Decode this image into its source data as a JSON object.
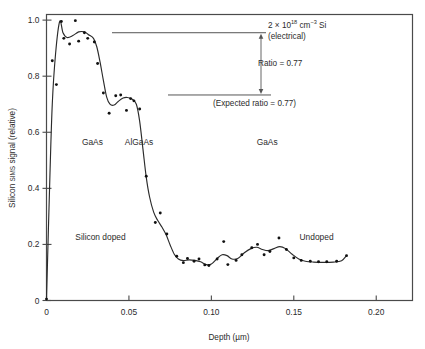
{
  "chart_data": {
    "type": "scatter",
    "title": "",
    "xlabel": "Depth  (µm)",
    "ylabel": "Silicon SIMS signal  (relative)",
    "ylabel_parts": {
      "pre": "Silicon ",
      "smallcaps": "SIMS",
      "post": " signal  (relative)"
    },
    "xlim": [
      0,
      0.222
    ],
    "ylim": [
      0,
      1.02
    ],
    "xticks": [
      0,
      0.05,
      0.1,
      0.15,
      0.2
    ],
    "xticklabels": [
      "0",
      "0.05",
      "0.10",
      "0.15",
      "0.20"
    ],
    "yticks": [
      0,
      0.2,
      0.4,
      0.6,
      0.8,
      1.0
    ],
    "yticklabels": [
      "0",
      "0.2",
      "0.4",
      "0.6",
      "0.8",
      "1.0"
    ],
    "grid": false,
    "legend": "none",
    "series": [
      {
        "name": "Silicon SIMS signal (data points)",
        "marker": "dot",
        "points": [
          [
            0.0,
            0.005
          ],
          [
            0.0035,
            0.855
          ],
          [
            0.006,
            0.77
          ],
          [
            0.009,
            0.995
          ],
          [
            0.0105,
            0.935
          ],
          [
            0.014,
            0.915
          ],
          [
            0.0175,
            0.998
          ],
          [
            0.0195,
            0.925
          ],
          [
            0.023,
            0.955
          ],
          [
            0.025,
            0.935
          ],
          [
            0.029,
            0.922
          ],
          [
            0.031,
            0.845
          ],
          [
            0.0345,
            0.74
          ],
          [
            0.038,
            0.668
          ],
          [
            0.042,
            0.73
          ],
          [
            0.045,
            0.733
          ],
          [
            0.0485,
            0.678
          ],
          [
            0.051,
            0.72
          ],
          [
            0.053,
            0.712
          ],
          [
            0.0565,
            0.683
          ],
          [
            0.0605,
            0.443
          ],
          [
            0.066,
            0.278
          ],
          [
            0.069,
            0.312
          ],
          [
            0.073,
            0.237
          ],
          [
            0.079,
            0.158
          ],
          [
            0.083,
            0.135
          ],
          [
            0.0855,
            0.15
          ],
          [
            0.0895,
            0.14
          ],
          [
            0.0925,
            0.148
          ],
          [
            0.096,
            0.127
          ],
          [
            0.0985,
            0.125
          ],
          [
            0.1035,
            0.148
          ],
          [
            0.1075,
            0.21
          ],
          [
            0.11,
            0.128
          ],
          [
            0.115,
            0.143
          ],
          [
            0.1185,
            0.163
          ],
          [
            0.1245,
            0.188
          ],
          [
            0.128,
            0.2
          ],
          [
            0.132,
            0.163
          ],
          [
            0.1355,
            0.175
          ],
          [
            0.141,
            0.223
          ],
          [
            0.1455,
            0.182
          ],
          [
            0.15,
            0.152
          ],
          [
            0.1545,
            0.143
          ],
          [
            0.16,
            0.14
          ],
          [
            0.165,
            0.138
          ],
          [
            0.17,
            0.138
          ],
          [
            0.176,
            0.14
          ],
          [
            0.182,
            0.16
          ]
        ]
      },
      {
        "name": "Smoothed profile (fitted curve)",
        "marker": "line",
        "points": [
          [
            0.0,
            0.005
          ],
          [
            0.002,
            0.43
          ],
          [
            0.0035,
            0.7
          ],
          [
            0.0055,
            0.88
          ],
          [
            0.008,
            0.995
          ],
          [
            0.01,
            0.955
          ],
          [
            0.0125,
            0.938
          ],
          [
            0.016,
            0.945
          ],
          [
            0.0195,
            0.958
          ],
          [
            0.023,
            0.958
          ],
          [
            0.0255,
            0.948
          ],
          [
            0.0285,
            0.935
          ],
          [
            0.0305,
            0.905
          ],
          [
            0.0325,
            0.85
          ],
          [
            0.0345,
            0.785
          ],
          [
            0.0365,
            0.725
          ],
          [
            0.0385,
            0.7
          ],
          [
            0.041,
            0.697
          ],
          [
            0.0435,
            0.71
          ],
          [
            0.0465,
            0.722
          ],
          [
            0.049,
            0.724
          ],
          [
            0.052,
            0.718
          ],
          [
            0.0545,
            0.7
          ],
          [
            0.0565,
            0.64
          ],
          [
            0.0585,
            0.54
          ],
          [
            0.0605,
            0.44
          ],
          [
            0.0625,
            0.37
          ],
          [
            0.065,
            0.315
          ],
          [
            0.0675,
            0.285
          ],
          [
            0.07,
            0.262
          ],
          [
            0.0725,
            0.235
          ],
          [
            0.075,
            0.198
          ],
          [
            0.0775,
            0.165
          ],
          [
            0.08,
            0.148
          ],
          [
            0.083,
            0.142
          ],
          [
            0.0865,
            0.145
          ],
          [
            0.09,
            0.143
          ],
          [
            0.0935,
            0.138
          ],
          [
            0.097,
            0.128
          ],
          [
            0.1,
            0.13
          ],
          [
            0.1035,
            0.15
          ],
          [
            0.1065,
            0.163
          ],
          [
            0.1095,
            0.16
          ],
          [
            0.1125,
            0.148
          ],
          [
            0.116,
            0.15
          ],
          [
            0.12,
            0.17
          ],
          [
            0.124,
            0.185
          ],
          [
            0.1275,
            0.19
          ],
          [
            0.131,
            0.182
          ],
          [
            0.1345,
            0.178
          ],
          [
            0.138,
            0.185
          ],
          [
            0.1415,
            0.192
          ],
          [
            0.145,
            0.185
          ],
          [
            0.149,
            0.165
          ],
          [
            0.153,
            0.148
          ],
          [
            0.157,
            0.14
          ],
          [
            0.162,
            0.137
          ],
          [
            0.168,
            0.136
          ],
          [
            0.174,
            0.137
          ],
          [
            0.179,
            0.142
          ],
          [
            0.182,
            0.16
          ]
        ]
      }
    ],
    "region_labels": [
      {
        "text": "GaAs",
        "x": 0.0215,
        "y": 0.555
      },
      {
        "text": "AlGaAs",
        "x": 0.0475,
        "y": 0.555
      },
      {
        "text": "GaAs",
        "x": 0.1275,
        "y": 0.555
      }
    ],
    "doping_labels": [
      {
        "text": "Silicon doped",
        "x": 0.0175,
        "y": 0.215
      },
      {
        "text": "Undoped",
        "x": 0.1535,
        "y": 0.215
      }
    ],
    "annotations": {
      "upper_level": {
        "label_pre": "2 × 10",
        "label_sup": "18",
        "label_post": " cm",
        "label_sup2": "−3",
        "label_post2": " Si",
        "label_line2": "(electrical)",
        "value": 0.955
      },
      "ratio_label": "Ratio = 0.77",
      "lower_label": "(Expected ratio = 0.77)",
      "lower_level": 0.733
    },
    "colors": {
      "curve": "#2b2b2b",
      "points": "#111111",
      "frame": "#4a4a4a",
      "annotation": "#555555",
      "text": "#2b2b2b",
      "background": "#ffffff"
    }
  }
}
